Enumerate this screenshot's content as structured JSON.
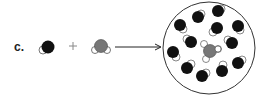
{
  "figure": {
    "part_label": "c.",
    "operator_plus": "+",
    "arrow": "right-arrow",
    "reactant_1": {
      "name": "solvent-molecule",
      "color": "#111111",
      "partner_color": "#ffffff"
    },
    "reactant_2": {
      "name": "solute-molecule",
      "color": "#777777",
      "partner_color": "#ffffff"
    },
    "product": {
      "name": "solution-container",
      "description": "circle containing many dark solvent molecules surrounding one gray solute molecule with white attached atoms",
      "solvent_molecule_count": 12,
      "solute_molecule_count": 1
    },
    "colors": {
      "dark": "#111111",
      "gray": "#777777",
      "outline": "#444444",
      "background": "#ffffff"
    }
  }
}
